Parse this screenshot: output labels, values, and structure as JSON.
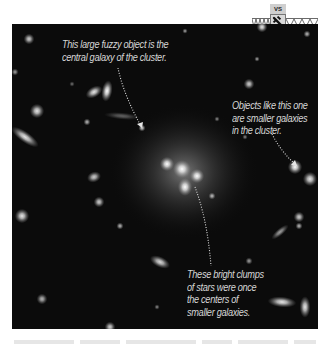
{
  "badge": {
    "label": "VS",
    "icon": "hubble-telescope-icon"
  },
  "captions": {
    "central_galaxy": {
      "lines": [
        "This large fuzzy object is the",
        "central galaxy of the cluster."
      ]
    },
    "smaller_galaxies": {
      "lines": [
        "Objects like this one",
        "are smaller galaxies",
        "in the cluster."
      ]
    },
    "bright_clumps": {
      "lines": [
        "These bright clumps",
        "of stars were once",
        "the centers of",
        "smaller galaxies."
      ]
    }
  },
  "image": {
    "subject": "galaxy cluster",
    "background_color": "#0b0b0b",
    "caption_color": "#d6d6d6",
    "core": {
      "x": 172,
      "y": 148
    },
    "objects": [
      {
        "x": 17,
        "y": 15,
        "r": 3,
        "rx": 3,
        "ry": 3,
        "rot": 0,
        "b": 0.8
      },
      {
        "x": 3,
        "y": 48,
        "r": 2,
        "rx": 2,
        "ry": 2,
        "rot": 0,
        "b": 0.6
      },
      {
        "x": 82,
        "y": 68,
        "r": 4,
        "rx": 5,
        "ry": 3,
        "rot": -30,
        "b": 0.9
      },
      {
        "x": 95,
        "y": 67,
        "r": 4,
        "rx": 3,
        "ry": 6,
        "rot": 10,
        "b": 1.0
      },
      {
        "x": 25,
        "y": 87,
        "r": 4,
        "rx": 4,
        "ry": 4,
        "rot": 0,
        "b": 0.9
      },
      {
        "x": 75,
        "y": 98,
        "r": 2,
        "rx": 2,
        "ry": 2,
        "rot": 0,
        "b": 0.7
      },
      {
        "x": 110,
        "y": 92,
        "r": 3,
        "rx": 10,
        "ry": 2,
        "rot": 5,
        "b": 0.35
      },
      {
        "x": 13,
        "y": 113,
        "r": 4,
        "rx": 9,
        "ry": 3,
        "rot": 35,
        "b": 0.9
      },
      {
        "x": 130,
        "y": 104,
        "r": 2,
        "rx": 2,
        "ry": 2,
        "rot": 0,
        "b": 0.8
      },
      {
        "x": 237,
        "y": 60,
        "r": 3,
        "rx": 3,
        "ry": 3,
        "rot": 0,
        "b": 0.8
      },
      {
        "x": 250,
        "y": 3,
        "r": 3,
        "rx": 3,
        "ry": 3,
        "rot": 0,
        "b": 0.9
      },
      {
        "x": 295,
        "y": 10,
        "r": 2,
        "rx": 2,
        "ry": 2,
        "rot": 0,
        "b": 0.7
      },
      {
        "x": 173,
        "y": 7,
        "r": 1,
        "rx": 1.5,
        "ry": 1.5,
        "rot": 0,
        "b": 0.6
      },
      {
        "x": 245,
        "y": 35,
        "r": 1,
        "rx": 1.5,
        "ry": 1.5,
        "rot": 0,
        "b": 0.6
      },
      {
        "x": 155,
        "y": 140,
        "r": 5,
        "rx": 4,
        "ry": 4,
        "rot": 0,
        "b": 1.0
      },
      {
        "x": 170,
        "y": 145,
        "r": 5,
        "rx": 5,
        "ry": 5,
        "rot": 0,
        "b": 1.0
      },
      {
        "x": 185,
        "y": 152,
        "r": 5,
        "rx": 4,
        "ry": 4,
        "rot": 0,
        "b": 1.0
      },
      {
        "x": 173,
        "y": 163,
        "r": 5,
        "rx": 4,
        "ry": 5,
        "rot": 0,
        "b": 1.0
      },
      {
        "x": 283,
        "y": 143,
        "r": 4,
        "rx": 4,
        "ry": 4,
        "rot": 0,
        "b": 1.0
      },
      {
        "x": 82,
        "y": 153,
        "r": 3,
        "rx": 4,
        "ry": 3,
        "rot": -20,
        "b": 0.8
      },
      {
        "x": 298,
        "y": 155,
        "r": 4,
        "rx": 4,
        "ry": 4,
        "rot": 0,
        "b": 0.9
      },
      {
        "x": 10,
        "y": 192,
        "r": 4,
        "rx": 4,
        "ry": 4,
        "rot": 0,
        "b": 0.9
      },
      {
        "x": 87,
        "y": 178,
        "r": 3,
        "rx": 3,
        "ry": 3,
        "rot": 0,
        "b": 0.8
      },
      {
        "x": 108,
        "y": 202,
        "r": 2,
        "rx": 2,
        "ry": 2,
        "rot": 0,
        "b": 0.7
      },
      {
        "x": 200,
        "y": 172,
        "r": 2,
        "rx": 2,
        "ry": 2,
        "rot": 0,
        "b": 0.7
      },
      {
        "x": 148,
        "y": 238,
        "r": 4,
        "rx": 6,
        "ry": 3,
        "rot": 25,
        "b": 0.85
      },
      {
        "x": 237,
        "y": 237,
        "r": 2,
        "rx": 2,
        "ry": 2,
        "rot": 0,
        "b": 0.6
      },
      {
        "x": 268,
        "y": 208,
        "r": 3,
        "rx": 6,
        "ry": 2,
        "rot": -40,
        "b": 0.6
      },
      {
        "x": 287,
        "y": 193,
        "r": 3,
        "rx": 3,
        "ry": 3,
        "rot": 0,
        "b": 0.8
      },
      {
        "x": 287,
        "y": 202,
        "r": 2,
        "rx": 2,
        "ry": 2,
        "rot": 0,
        "b": 0.7
      },
      {
        "x": 30,
        "y": 275,
        "r": 3,
        "rx": 3,
        "ry": 3,
        "rot": 0,
        "b": 0.7
      },
      {
        "x": 270,
        "y": 278,
        "r": 4,
        "rx": 8,
        "ry": 3,
        "rot": 5,
        "b": 0.9
      },
      {
        "x": 293,
        "y": 283,
        "r": 4,
        "rx": 3,
        "ry": 6,
        "rot": 0,
        "b": 0.9
      },
      {
        "x": 98,
        "y": 303,
        "r": 3,
        "rx": 3,
        "ry": 3,
        "rot": 0,
        "b": 0.8
      },
      {
        "x": 145,
        "y": 283,
        "r": 1,
        "rx": 1.5,
        "ry": 1.5,
        "rot": 0,
        "b": 0.5
      },
      {
        "x": 233,
        "y": 113,
        "r": 1,
        "rx": 1.5,
        "ry": 1.5,
        "rot": 0,
        "b": 0.5
      },
      {
        "x": 60,
        "y": 60,
        "r": 1,
        "rx": 1.5,
        "ry": 1.5,
        "rot": 0,
        "b": 0.4
      },
      {
        "x": 205,
        "y": 95,
        "r": 1,
        "rx": 1.5,
        "ry": 1.5,
        "rot": 0,
        "b": 0.5
      }
    ]
  }
}
